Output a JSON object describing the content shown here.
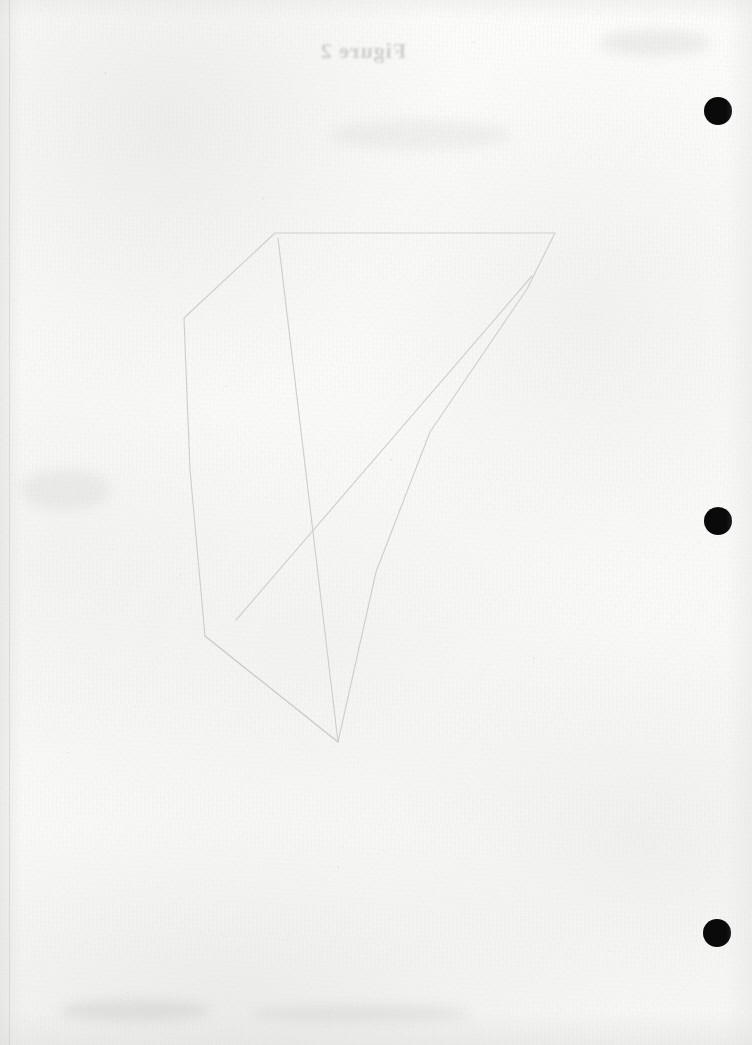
{
  "page": {
    "kind": "scanned-document-page",
    "width": 752,
    "height": 1045,
    "paper_color": "#fbfbfa",
    "ink_color": "#0a0a0a",
    "pencil_color": "#c9c9c7"
  },
  "showthrough": {
    "label": "Figure 2",
    "note": "mirrored bleed-through text from reverse side of sheet",
    "color": "#a8a8a6"
  },
  "punch_marks": {
    "label": "punch hole marks",
    "color": "#0a0a0a",
    "count": 3,
    "items": [
      {
        "name": "punch-mark-top",
        "cx": 718,
        "cy": 111,
        "r": 14
      },
      {
        "name": "punch-mark-middle",
        "cx": 718,
        "cy": 521,
        "r": 14
      },
      {
        "name": "punch-mark-bottom",
        "cx": 717,
        "cy": 933,
        "r": 14
      }
    ]
  },
  "drawing": {
    "label": "faint pencil polygon construction",
    "stroke_color": "#cdcdcb",
    "outline": [
      [
        275,
        233
      ],
      [
        555,
        233
      ],
      [
        527,
        289
      ],
      [
        430,
        432
      ],
      [
        376,
        572
      ],
      [
        338,
        742
      ],
      [
        205,
        636
      ],
      [
        190,
        470
      ],
      [
        184,
        318
      ]
    ],
    "chords": [
      {
        "name": "chord-upper-right-to-lower-left",
        "from": [
          532,
          276
        ],
        "to": [
          236,
          620
        ]
      },
      {
        "name": "chord-top-left-to-bottom-vertex",
        "from": [
          278,
          238
        ],
        "to": [
          338,
          742
        ]
      },
      {
        "name": "chord-left-edge-to-bottom",
        "from": [
          205,
          636
        ],
        "to": [
          338,
          742
        ]
      }
    ]
  },
  "smudges": {
    "label": "scanner smudges and paper staining",
    "items": [
      {
        "name": "smudge-bottom-left",
        "x": 60,
        "y": 1000,
        "w": 150,
        "h": 22,
        "opacity": 0.4
      },
      {
        "name": "smudge-bottom-mid",
        "x": 250,
        "y": 1005,
        "w": 220,
        "h": 18,
        "opacity": 0.34
      },
      {
        "name": "smudge-top-right",
        "x": 600,
        "y": 30,
        "w": 110,
        "h": 26,
        "opacity": 0.26
      },
      {
        "name": "smudge-mid-left",
        "x": 20,
        "y": 470,
        "w": 90,
        "h": 40,
        "opacity": 0.22
      },
      {
        "name": "smudge-upper-center",
        "x": 330,
        "y": 120,
        "w": 180,
        "h": 30,
        "opacity": 0.2
      }
    ]
  }
}
